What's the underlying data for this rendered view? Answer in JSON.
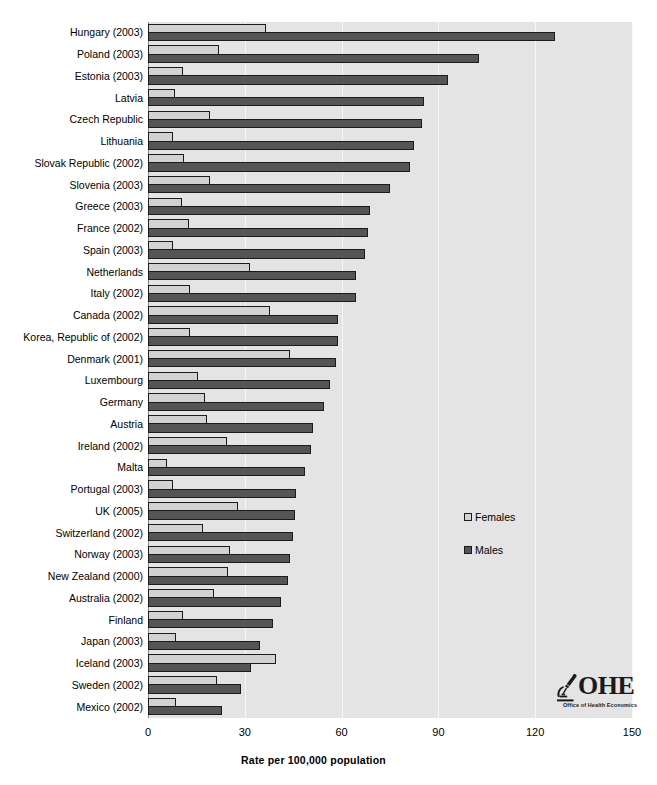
{
  "chart_data": {
    "type": "bar",
    "orientation": "horizontal",
    "title": "",
    "xlabel": "Rate per 100,000 population",
    "ylabel": "",
    "xlim": [
      0,
      150
    ],
    "xticks": [
      0,
      30,
      60,
      90,
      120,
      150
    ],
    "grid": true,
    "legend_position": "center-right",
    "categories": [
      "Hungary (2003)",
      "Poland (2003)",
      "Estonia (2003)",
      "Latvia",
      "Czech Republic",
      "Lithuania",
      "Slovak Republic (2002)",
      "Slovenia (2003)",
      "Greece (2003)",
      "France (2002)",
      "Spain (2003)",
      "Netherlands",
      "Italy (2002)",
      "Canada (2002)",
      "Korea, Republic of (2002)",
      "Denmark (2001)",
      "Luxembourg",
      "Germany",
      "Austria",
      "Ireland (2002)",
      "Malta",
      "Portugal (2003)",
      "UK (2005)",
      "Switzerland (2002)",
      "Norway (2003)",
      "New Zealand (2000)",
      "Australia (2002)",
      "Finland",
      "Japan (2003)",
      "Iceland (2003)",
      "Sweden (2002)",
      "Mexico (2002)"
    ],
    "series": [
      {
        "name": "Females",
        "color": "#d2d2d2",
        "values": [
          36.5,
          22.0,
          10.7,
          8.4,
          19.1,
          7.8,
          11.2,
          19.1,
          10.4,
          12.6,
          7.8,
          31.5,
          13.0,
          37.9,
          13.0,
          44.0,
          15.6,
          17.7,
          18.3,
          24.5,
          5.8,
          7.6,
          28.0,
          16.9,
          25.4,
          24.9,
          20.4,
          10.7,
          8.7,
          39.6,
          21.4,
          8.7
        ]
      },
      {
        "name": "Males",
        "color": "#555555",
        "values": [
          126.0,
          102.5,
          92.9,
          85.4,
          84.9,
          82.4,
          81.1,
          74.9,
          68.7,
          68.3,
          67.4,
          64.4,
          64.4,
          58.8,
          58.8,
          58.3,
          56.5,
          54.7,
          51.1,
          50.4,
          48.6,
          46.0,
          45.5,
          44.8,
          44.0,
          43.5,
          41.3,
          38.7,
          34.7,
          31.8,
          28.7,
          22.8
        ]
      }
    ]
  },
  "legend": {
    "items": [
      {
        "label": "Females"
      },
      {
        "label": "Males"
      }
    ]
  },
  "logo": {
    "letters": "OHE",
    "subtitle": "Office of Health Economics"
  }
}
